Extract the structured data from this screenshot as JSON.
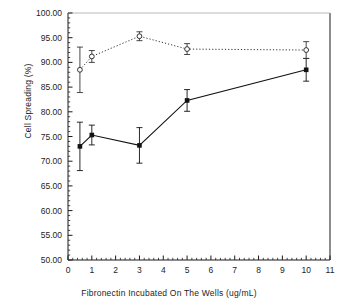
{
  "chart_data": {
    "type": "line",
    "title": "",
    "xlabel": "Fibronectin Incubated On The Wells (ug/mL)",
    "ylabel": "Cell Spreading (%)",
    "xlim": [
      0,
      11
    ],
    "ylim": [
      50,
      100
    ],
    "xticks": [
      0,
      1,
      2,
      3,
      4,
      5,
      6,
      7,
      8,
      9,
      10,
      11
    ],
    "xtick_labels": [
      "0",
      "1",
      "2",
      "3",
      "4",
      "5",
      "6",
      "7",
      "8",
      "9",
      "10",
      "11"
    ],
    "yticks": [
      50,
      55,
      60,
      65,
      70,
      75,
      80,
      85,
      90,
      95,
      100
    ],
    "ytick_labels": [
      "50.00",
      "55.00",
      "60.00",
      "65.00",
      "70.00",
      "75.00",
      "80.00",
      "85.00",
      "90.00",
      "95.00",
      "100.00"
    ],
    "minor_ticks": true,
    "grid": false,
    "legend": "none",
    "error_bars": "symmetric",
    "x": [
      0.5,
      1,
      3,
      5,
      10
    ],
    "series": [
      {
        "name": "solid-filled-square",
        "line_style": "solid",
        "marker": "filled-square",
        "color": "#111111",
        "values": [
          73.0,
          75.3,
          73.2,
          82.3,
          88.5
        ],
        "errors": [
          4.9,
          2.0,
          3.6,
          2.2,
          2.3
        ]
      },
      {
        "name": "dotted-open-circle",
        "line_style": "dotted",
        "marker": "open-circle",
        "color": "#333333",
        "values": [
          88.5,
          91.2,
          95.3,
          92.7,
          92.5
        ],
        "errors": [
          4.6,
          1.2,
          0.9,
          1.1,
          1.7
        ]
      }
    ]
  },
  "colors": {
    "axis": "#1a1a1a",
    "background": "#ffffff",
    "series_solid": "#111111",
    "series_dotted": "#333333"
  }
}
